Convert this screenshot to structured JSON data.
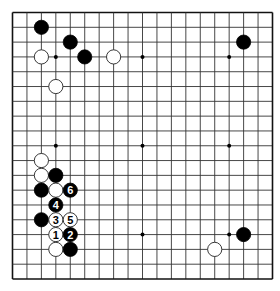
{
  "diagram": {
    "type": "go-board",
    "size": 19,
    "colors": {
      "background": "#ffffff",
      "line": "#333333",
      "border": "#111111",
      "black_stone": "#000000",
      "white_stone": "#ffffff",
      "white_stone_edge": "#222222"
    },
    "hoshi": [
      [
        3,
        3
      ],
      [
        9,
        3
      ],
      [
        15,
        3
      ],
      [
        3,
        9
      ],
      [
        9,
        9
      ],
      [
        15,
        9
      ],
      [
        3,
        15
      ],
      [
        9,
        15
      ],
      [
        15,
        15
      ]
    ],
    "stones": [
      {
        "color": "black",
        "x": 2,
        "y": 1,
        "label": ""
      },
      {
        "color": "black",
        "x": 4,
        "y": 2,
        "label": ""
      },
      {
        "color": "white",
        "x": 2,
        "y": 3,
        "label": ""
      },
      {
        "color": "black",
        "x": 5,
        "y": 3,
        "label": ""
      },
      {
        "color": "white",
        "x": 7,
        "y": 3,
        "label": ""
      },
      {
        "color": "white",
        "x": 3,
        "y": 5,
        "label": ""
      },
      {
        "color": "black",
        "x": 16,
        "y": 2,
        "label": ""
      },
      {
        "color": "white",
        "x": 2,
        "y": 10,
        "label": ""
      },
      {
        "color": "white",
        "x": 2,
        "y": 11,
        "label": ""
      },
      {
        "color": "black",
        "x": 3,
        "y": 11,
        "label": ""
      },
      {
        "color": "black",
        "x": 2,
        "y": 12,
        "label": ""
      },
      {
        "color": "white",
        "x": 3,
        "y": 12,
        "label": ""
      },
      {
        "color": "black",
        "x": 4,
        "y": 12,
        "label": "6"
      },
      {
        "color": "black",
        "x": 3,
        "y": 13,
        "label": "4"
      },
      {
        "color": "black",
        "x": 2,
        "y": 14,
        "label": ""
      },
      {
        "color": "white",
        "x": 3,
        "y": 14,
        "label": "3"
      },
      {
        "color": "white",
        "x": 4,
        "y": 14,
        "label": "5"
      },
      {
        "color": "white",
        "x": 3,
        "y": 15,
        "label": "1"
      },
      {
        "color": "black",
        "x": 4,
        "y": 15,
        "label": "2"
      },
      {
        "color": "white",
        "x": 3,
        "y": 16,
        "label": ""
      },
      {
        "color": "black",
        "x": 4,
        "y": 16,
        "label": ""
      },
      {
        "color": "black",
        "x": 16,
        "y": 15,
        "label": ""
      },
      {
        "color": "white",
        "x": 14,
        "y": 16,
        "label": ""
      }
    ]
  }
}
